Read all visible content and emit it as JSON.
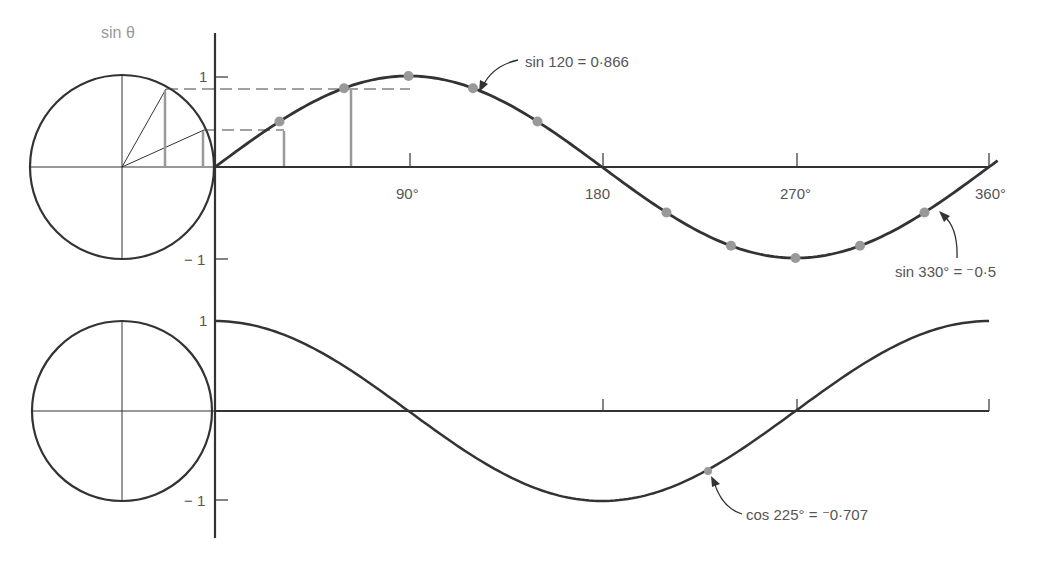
{
  "chart_data": [
    {
      "type": "line",
      "title": "",
      "function": "sin",
      "circle_label": "sin θ",
      "xlabel": "",
      "ylabel": "",
      "x_ticks": [
        "90°",
        "180",
        "270°",
        "360°"
      ],
      "y_ticks": [
        "1",
        "−1"
      ],
      "xlim": [
        0,
        360
      ],
      "ylim": [
        -1,
        1
      ],
      "x": [
        0,
        30,
        60,
        90,
        120,
        150,
        180,
        210,
        240,
        270,
        300,
        330,
        360
      ],
      "values": [
        0,
        0.5,
        0.866,
        1,
        0.866,
        0.5,
        0,
        -0.5,
        -0.866,
        -1,
        -0.866,
        -0.5,
        0
      ],
      "marked_points_x": [
        30,
        60,
        90,
        120,
        150,
        210,
        240,
        270,
        300,
        330
      ],
      "annotations": [
        {
          "text": "sin 120 = 0·866",
          "x": 120,
          "y": 0.866
        },
        {
          "text": "sin 330° = ⁻0·5",
          "x": 330,
          "y": -0.5
        }
      ]
    },
    {
      "type": "line",
      "title": "",
      "function": "cos",
      "xlabel": "",
      "ylabel": "",
      "y_ticks": [
        "1",
        "−1"
      ],
      "xlim": [
        0,
        360
      ],
      "ylim": [
        -1,
        1
      ],
      "x": [
        0,
        45,
        90,
        135,
        180,
        225,
        270,
        315,
        360
      ],
      "values": [
        1,
        0.707,
        0,
        -0.707,
        -1,
        -0.707,
        0,
        0.707,
        1
      ],
      "annotations": [
        {
          "text": "cos 225° = ⁻0·707",
          "x": 225,
          "y": -0.707
        }
      ]
    }
  ],
  "labels": {
    "sin_theta": "sin θ",
    "top_y1": "1",
    "top_ym1": "− 1",
    "bot_y1": "1",
    "bot_ym1": "− 1",
    "x90": "90°",
    "x180": "180",
    "x270": "270°",
    "x360": "360°",
    "ann_sin120": "sin 120 = 0·866",
    "ann_sin330": "sin 330° = ⁻0·5",
    "ann_cos225": "cos 225° = ⁻0·707"
  }
}
